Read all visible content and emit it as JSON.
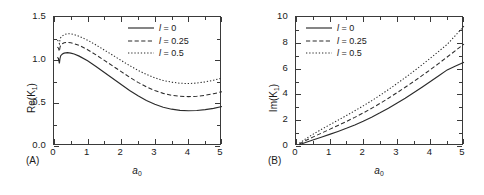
{
  "figure": {
    "width": 484,
    "height": 195,
    "background": "#ffffff",
    "line_color": "#2b2b2b"
  },
  "panels": [
    {
      "tag": "(A)",
      "ylabel_pre": "Re(K",
      "ylabel_sub": "1",
      "ylabel_post": ")",
      "xlabel_pre": "a",
      "xlabel_sub": "0",
      "yticks": [
        "0.0",
        "0.5",
        "1.0",
        "1.5"
      ],
      "ytick_values": [
        0.0,
        0.5,
        1.0,
        1.5
      ],
      "xticks": [
        "0",
        "1",
        "2",
        "3",
        "4",
        "5"
      ],
      "xtick_values": [
        0,
        1,
        2,
        3,
        4,
        5
      ]
    },
    {
      "tag": "(B)",
      "ylabel_pre": "Im(K",
      "ylabel_sub": "1",
      "ylabel_post": ")",
      "xlabel_pre": "a",
      "xlabel_sub": "0",
      "yticks": [
        "0",
        "2",
        "4",
        "6",
        "8",
        "10"
      ],
      "ytick_values": [
        0,
        2,
        4,
        6,
        8,
        10
      ],
      "xticks": [
        "0",
        "1",
        "2",
        "3",
        "4",
        "5"
      ],
      "xtick_values": [
        0,
        1,
        2,
        3,
        4,
        5
      ]
    }
  ],
  "legend": {
    "entries": [
      {
        "symbol": "l",
        "eq": " = ",
        "value": "0",
        "style": "solid"
      },
      {
        "symbol": "l",
        "eq": " = ",
        "value": "0.25",
        "style": "dashed"
      },
      {
        "symbol": "l",
        "eq": " = ",
        "value": "0.5",
        "style": "dotted"
      }
    ]
  },
  "chart_data": [
    {
      "type": "line",
      "title": "",
      "panel": "(A)",
      "xlabel": "a_0",
      "ylabel": "Re(K_1)",
      "xlim": [
        0,
        5
      ],
      "ylim": [
        0.0,
        1.5
      ],
      "xticks": [
        0,
        1,
        2,
        3,
        4,
        5
      ],
      "yticks": [
        0.0,
        0.5,
        1.0,
        1.5
      ],
      "grid": false,
      "legend_position": "top-right",
      "series": [
        {
          "name": "l = 0",
          "style": "solid",
          "x": [
            0.1,
            0.13,
            0.16,
            0.18,
            0.2,
            0.25,
            0.3,
            0.4,
            0.5,
            0.6,
            0.75,
            1.0,
            1.25,
            1.5,
            1.75,
            2.0,
            2.25,
            2.5,
            2.75,
            3.0,
            3.25,
            3.5,
            3.75,
            4.0,
            4.25,
            4.5,
            4.75,
            5.0
          ],
          "y": [
            1.03,
            1.02,
            0.96,
            1.02,
            1.05,
            1.07,
            1.08,
            1.085,
            1.08,
            1.07,
            1.045,
            0.99,
            0.925,
            0.855,
            0.785,
            0.715,
            0.645,
            0.585,
            0.53,
            0.485,
            0.45,
            0.428,
            0.415,
            0.41,
            0.413,
            0.423,
            0.438,
            0.46
          ]
        },
        {
          "name": "l = 0.25",
          "style": "dashed",
          "x": [
            0.1,
            0.13,
            0.16,
            0.18,
            0.2,
            0.25,
            0.3,
            0.4,
            0.5,
            0.6,
            0.75,
            1.0,
            1.25,
            1.5,
            1.75,
            2.0,
            2.25,
            2.5,
            2.75,
            3.0,
            3.25,
            3.5,
            3.75,
            4.0,
            4.25,
            4.5,
            4.75,
            5.0
          ],
          "y": [
            1.15,
            1.14,
            1.1,
            1.15,
            1.17,
            1.19,
            1.2,
            1.205,
            1.2,
            1.19,
            1.17,
            1.12,
            1.06,
            0.995,
            0.93,
            0.865,
            0.8,
            0.74,
            0.688,
            0.645,
            0.612,
            0.59,
            0.578,
            0.574,
            0.578,
            0.59,
            0.608,
            0.632
          ]
        },
        {
          "name": "l = 0.5",
          "style": "dotted",
          "x": [
            0.1,
            0.13,
            0.16,
            0.18,
            0.2,
            0.25,
            0.3,
            0.4,
            0.5,
            0.6,
            0.75,
            1.0,
            1.25,
            1.5,
            1.75,
            2.0,
            2.25,
            2.5,
            2.75,
            3.0,
            3.25,
            3.5,
            3.75,
            4.0,
            4.25,
            4.5,
            4.75,
            5.0
          ],
          "y": [
            1.23,
            1.22,
            1.19,
            1.24,
            1.26,
            1.28,
            1.295,
            1.305,
            1.305,
            1.295,
            1.275,
            1.23,
            1.175,
            1.115,
            1.055,
            0.995,
            0.935,
            0.88,
            0.832,
            0.792,
            0.762,
            0.742,
            0.73,
            0.726,
            0.732,
            0.745,
            0.765,
            0.79
          ]
        }
      ]
    },
    {
      "type": "line",
      "title": "",
      "panel": "(B)",
      "xlabel": "a_0",
      "ylabel": "Im(K_1)",
      "xlim": [
        0,
        5
      ],
      "ylim": [
        0,
        10
      ],
      "xticks": [
        0,
        1,
        2,
        3,
        4,
        5
      ],
      "yticks": [
        0,
        2,
        4,
        6,
        8,
        10
      ],
      "grid": false,
      "legend_position": "top-left",
      "series": [
        {
          "name": "l = 0",
          "style": "solid",
          "x": [
            0.1,
            0.2,
            0.35,
            0.5,
            0.75,
            1.0,
            1.25,
            1.5,
            1.75,
            2.0,
            2.25,
            2.5,
            2.75,
            3.0,
            3.25,
            3.5,
            3.75,
            4.0,
            4.25,
            4.5,
            4.75,
            5.0
          ],
          "y": [
            0.1,
            0.2,
            0.33,
            0.46,
            0.68,
            0.9,
            1.13,
            1.37,
            1.63,
            1.92,
            2.23,
            2.57,
            2.93,
            3.31,
            3.7,
            4.12,
            4.56,
            5.0,
            5.45,
            5.9,
            6.2,
            6.5
          ]
        },
        {
          "name": "l = 0.25",
          "style": "dashed",
          "x": [
            0.1,
            0.2,
            0.35,
            0.5,
            0.75,
            1.0,
            1.25,
            1.5,
            1.75,
            2.0,
            2.25,
            2.5,
            2.75,
            3.0,
            3.25,
            3.5,
            3.75,
            4.0,
            4.25,
            4.5,
            4.75,
            5.0
          ],
          "y": [
            0.16,
            0.3,
            0.5,
            0.69,
            0.99,
            1.29,
            1.59,
            1.9,
            2.22,
            2.56,
            2.92,
            3.3,
            3.7,
            4.12,
            4.55,
            4.99,
            5.45,
            5.92,
            6.4,
            6.9,
            7.4,
            7.9
          ]
        },
        {
          "name": "l = 0.5",
          "style": "dotted",
          "x": [
            0.1,
            0.2,
            0.35,
            0.5,
            0.75,
            1.0,
            1.25,
            1.5,
            1.75,
            2.0,
            2.25,
            2.5,
            2.75,
            3.0,
            3.25,
            3.5,
            3.75,
            4.0,
            4.25,
            4.5,
            4.75,
            5.0
          ],
          "y": [
            0.22,
            0.4,
            0.66,
            0.9,
            1.28,
            1.64,
            2.0,
            2.36,
            2.73,
            3.11,
            3.51,
            3.93,
            4.37,
            4.83,
            5.3,
            5.79,
            6.29,
            6.81,
            7.34,
            7.88,
            8.58,
            9.3
          ]
        }
      ]
    }
  ]
}
